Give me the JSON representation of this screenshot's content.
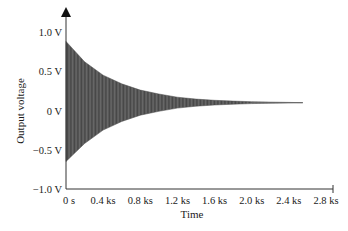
{
  "chart_data": {
    "type": "line",
    "title": "",
    "xlabel": "Time",
    "ylabel": "Output voltage",
    "x_ticks": [
      "0 s",
      "0.4 ks",
      "0.8 ks",
      "1.2 ks",
      "1.6 ks",
      "2.0 ks",
      "2.4 ks",
      "2.8 ks"
    ],
    "x_tick_values": [
      0,
      0.4,
      0.8,
      1.2,
      1.6,
      2.0,
      2.4,
      2.8
    ],
    "y_ticks": [
      "1.0 V",
      "0.5 V",
      "0 V",
      "−0.5 V",
      "−1.0 V"
    ],
    "y_tick_values": [
      1.0,
      0.5,
      0,
      -0.5,
      -1.0
    ],
    "xlim": [
      0,
      2.9
    ],
    "ylim": [
      -1.0,
      1.0
    ],
    "grid": false,
    "legend": null,
    "x_unit": "ks",
    "y_unit": "V",
    "series": [
      {
        "name": "Output voltage (damped oscillation envelope)",
        "description": "Rapid oscillation with exponentially decaying amplitude, settling to ~0.1 V",
        "offset": 0.1,
        "upper_envelope": {
          "x": [
            0,
            0.2,
            0.4,
            0.6,
            0.8,
            1.0,
            1.2,
            1.4,
            1.6,
            1.8,
            2.0,
            2.2,
            2.4,
            2.55
          ],
          "y": [
            0.88,
            0.62,
            0.45,
            0.34,
            0.26,
            0.21,
            0.17,
            0.145,
            0.13,
            0.12,
            0.112,
            0.107,
            0.103,
            0.1
          ]
        },
        "lower_envelope": {
          "x": [
            0,
            0.2,
            0.4,
            0.6,
            0.8,
            1.0,
            1.2,
            1.4,
            1.6,
            1.8,
            2.0,
            2.2,
            2.4,
            2.55
          ],
          "y": [
            -0.65,
            -0.42,
            -0.25,
            -0.14,
            -0.06,
            -0.01,
            0.03,
            0.055,
            0.07,
            0.08,
            0.088,
            0.093,
            0.097,
            0.1
          ]
        },
        "color": "#555555"
      }
    ]
  },
  "colors": {
    "fill": "#5a5a5a",
    "axis": "#333333",
    "text": "#1a1a1a",
    "background": "#ffffff"
  }
}
